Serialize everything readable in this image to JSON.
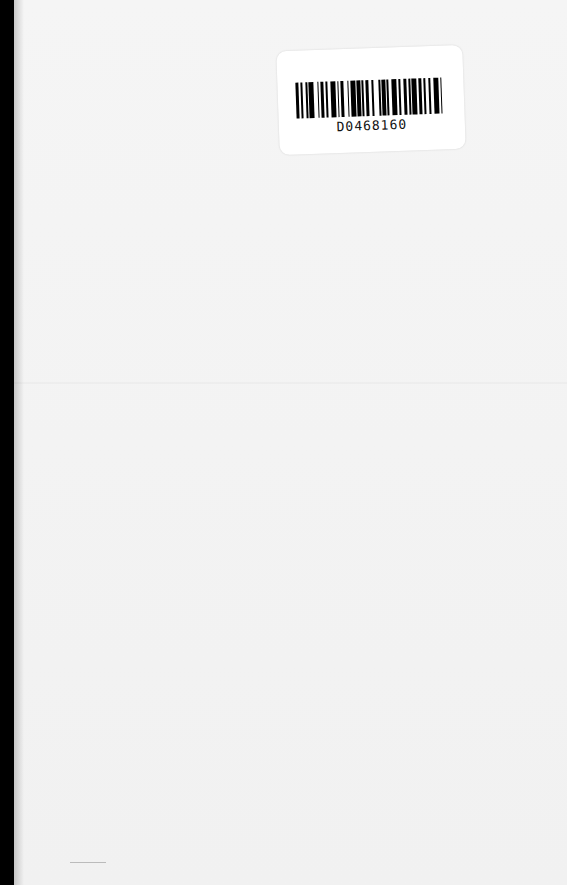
{
  "document": {
    "type": "scanned blank page",
    "barcode_sticker": {
      "code": "D0468160",
      "bars": [
        2,
        1,
        1,
        2,
        1,
        1,
        3,
        2,
        1,
        1,
        2,
        1,
        1,
        2,
        3,
        1,
        1,
        1,
        2,
        2,
        1,
        1,
        3,
        1,
        2,
        1,
        1,
        1,
        2,
        2,
        1,
        3,
        1,
        1,
        2,
        1,
        1,
        2,
        3,
        1,
        1,
        2,
        2,
        1,
        1,
        1,
        3,
        1,
        2,
        1,
        1,
        2,
        1,
        2,
        3,
        1,
        1,
        2
      ]
    },
    "colors": {
      "page": "#f3f3f3",
      "background": "#000000",
      "sticker": "#ffffff",
      "ink": "#000000"
    }
  }
}
